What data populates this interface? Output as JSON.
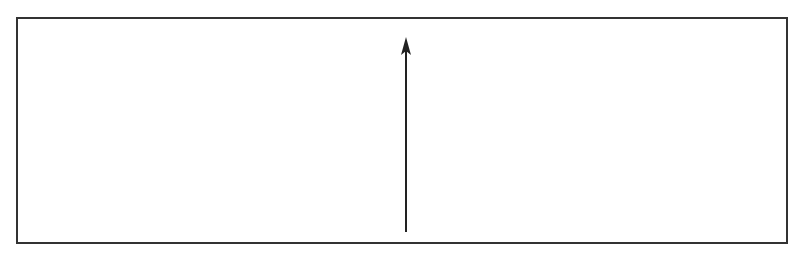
{
  "figure": {
    "caption": "",
    "frame": {
      "x": 16,
      "y": 17,
      "width": 772,
      "height": 227,
      "stroke": "#333333"
    },
    "arrow": {
      "x": 406,
      "y_start": 232,
      "y_end": 38,
      "direction": "up",
      "stroke": "#222222"
    }
  }
}
